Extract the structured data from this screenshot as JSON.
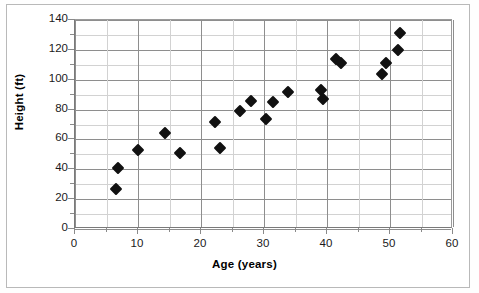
{
  "chart_data": {
    "type": "scatter",
    "title": "",
    "xlabel": "Age (years)",
    "ylabel": "Height (ft)",
    "xlim": [
      0,
      60
    ],
    "ylim": [
      0,
      140
    ],
    "x_major_ticks": [
      0,
      10,
      20,
      30,
      40,
      50,
      60
    ],
    "x_minor_step": 5,
    "y_major_ticks": [
      0,
      20,
      40,
      60,
      80,
      100,
      120,
      140
    ],
    "y_minor_step": 10,
    "x_tick_labels": [
      "0",
      "10",
      "20",
      "30",
      "40",
      "50",
      "60"
    ],
    "y_tick_labels": [
      "0",
      "20",
      "40",
      "60",
      "80",
      "100",
      "120",
      "140"
    ],
    "grid": true,
    "grid_axis": "both",
    "legend": false,
    "marker": "diamond",
    "marker_color": "#111111",
    "series": [
      {
        "name": "Height vs Age",
        "points": [
          {
            "x": 6.5,
            "y": 27
          },
          {
            "x": 6.8,
            "y": 41
          },
          {
            "x": 10.0,
            "y": 53
          },
          {
            "x": 14.3,
            "y": 64
          },
          {
            "x": 16.7,
            "y": 51
          },
          {
            "x": 22.2,
            "y": 72
          },
          {
            "x": 23.0,
            "y": 54
          },
          {
            "x": 26.2,
            "y": 79
          },
          {
            "x": 28.0,
            "y": 86
          },
          {
            "x": 30.3,
            "y": 74
          },
          {
            "x": 31.5,
            "y": 85
          },
          {
            "x": 33.8,
            "y": 92
          },
          {
            "x": 39.0,
            "y": 93
          },
          {
            "x": 39.3,
            "y": 87
          },
          {
            "x": 41.5,
            "y": 114
          },
          {
            "x": 42.3,
            "y": 111
          },
          {
            "x": 48.8,
            "y": 104
          },
          {
            "x": 49.3,
            "y": 111
          },
          {
            "x": 51.3,
            "y": 120
          },
          {
            "x": 51.6,
            "y": 131
          }
        ]
      }
    ]
  },
  "axes": {
    "y_title": "Height (ft)",
    "x_title": "Age (years)"
  }
}
